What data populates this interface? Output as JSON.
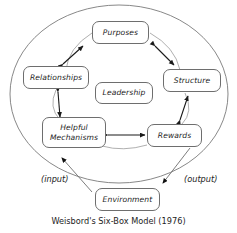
{
  "diagram": {
    "title": "Weisbord's Six-Box Model (1976)",
    "boundary_shape": "ellipse",
    "boxes": {
      "purposes": "Purposes",
      "relationships": "Relationships",
      "structure": "Structure",
      "leadership": "Leadership",
      "helpful_mechanisms_line1": "Helpful",
      "helpful_mechanisms_line2": "Mechanisms",
      "rewards": "Rewards",
      "environment": "Environment"
    },
    "labels": {
      "input": "(input)",
      "output": "(output)"
    },
    "colors": {
      "stroke": "#6e6e6e",
      "arrow": "#1a1a1a",
      "text": "#1d1d1d",
      "background": "#ffffff"
    }
  }
}
